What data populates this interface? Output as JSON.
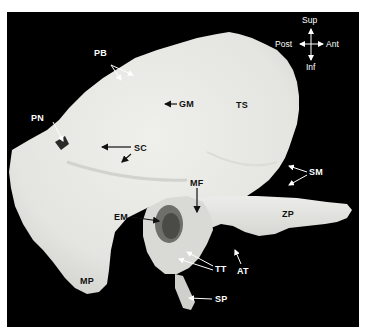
{
  "figure": {
    "background_color": "#000000",
    "bone_color": "#e9e9e6"
  },
  "orientation": {
    "sup": "Sup",
    "inf": "Inf",
    "post": "Post",
    "ant": "Ant"
  },
  "labels": {
    "pb": "PB",
    "pn": "PN",
    "gm": "GM",
    "ts": "TS",
    "sc": "SC",
    "sm": "SM",
    "mf": "MF",
    "em": "EM",
    "zp": "ZP",
    "tt": "TT",
    "at": "AT",
    "mp": "MP",
    "sp": "SP"
  }
}
